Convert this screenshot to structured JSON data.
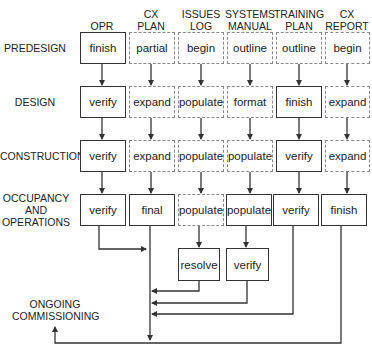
{
  "columns": [
    {
      "label_line1": "",
      "label_line2": "OPR"
    },
    {
      "label_line1": "CX",
      "label_line2": "PLAN"
    },
    {
      "label_line1": "ISSUES",
      "label_line2": "LOG"
    },
    {
      "label_line1": "SYSTEMS",
      "label_line2": "MANUAL"
    },
    {
      "label_line1": "TRAINING",
      "label_line2": "PLAN"
    },
    {
      "label_line1": "CX",
      "label_line2": "REPORT"
    }
  ],
  "rows": [
    {
      "label": "PREDESIGN"
    },
    {
      "label": "DESIGN"
    },
    {
      "label": "CONSTRUCTION"
    },
    {
      "label_line1": "OCCUPANCY",
      "label_line2": "AND",
      "label_line3": "OPERATIONS"
    }
  ],
  "cells": [
    [
      {
        "text": "finish",
        "style": "solid"
      },
      {
        "text": "partial",
        "style": "dashed"
      },
      {
        "text": "begin",
        "style": "dashed"
      },
      {
        "text": "outline",
        "style": "dashed"
      },
      {
        "text": "outline",
        "style": "dashed"
      },
      {
        "text": "begin",
        "style": "dashed"
      }
    ],
    [
      {
        "text": "verify",
        "style": "solid"
      },
      {
        "text": "expand",
        "style": "dashed"
      },
      {
        "text": "populate",
        "style": "dashed"
      },
      {
        "text": "format",
        "style": "dashed"
      },
      {
        "text": "finish",
        "style": "solid"
      },
      {
        "text": "expand",
        "style": "dashed"
      }
    ],
    [
      {
        "text": "verify",
        "style": "solid"
      },
      {
        "text": "expand",
        "style": "dashed"
      },
      {
        "text": "populate",
        "style": "dashed"
      },
      {
        "text": "populate",
        "style": "dashed"
      },
      {
        "text": "verify",
        "style": "solid"
      },
      {
        "text": "expand",
        "style": "dashed"
      }
    ],
    [
      {
        "text": "verify",
        "style": "solid"
      },
      {
        "text": "final",
        "style": "solid"
      },
      {
        "text": "populate",
        "style": "dashed"
      },
      {
        "text": "populate",
        "style": "solid"
      },
      {
        "text": "verify",
        "style": "solid"
      },
      {
        "text": "finish",
        "style": "solid"
      }
    ]
  ],
  "extra_boxes": [
    {
      "text": "resolve",
      "style": "solid"
    },
    {
      "text": "verify",
      "style": "solid"
    }
  ],
  "ongoing": {
    "label_line1": "ONGOING",
    "label_line2": "COMMISSIONING"
  },
  "colors": {
    "solid_border": "#333333",
    "dashed_border": "#888888",
    "line": "#333333"
  }
}
